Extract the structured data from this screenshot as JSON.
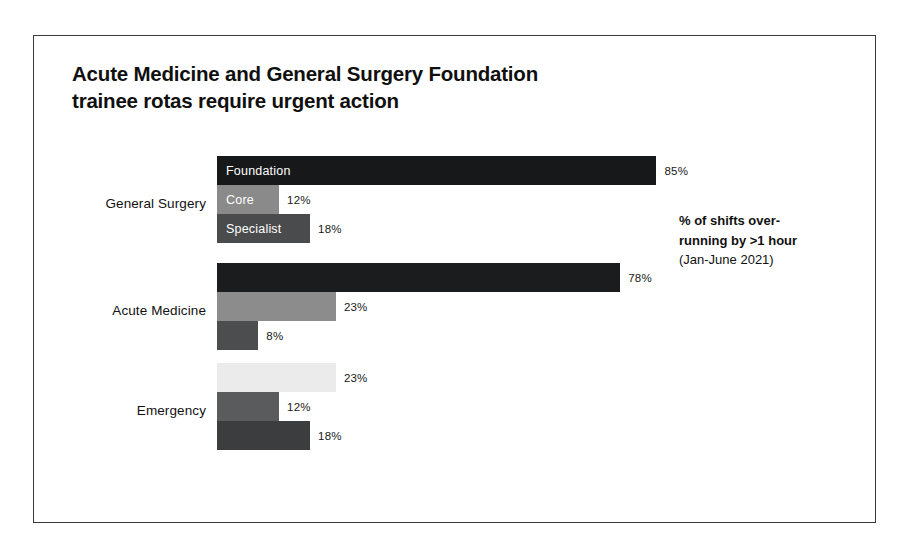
{
  "card": {
    "title_line1": "Acute Medicine and General Surgery Foundation",
    "title_line2": "trainee rotas require urgent action"
  },
  "annotation": {
    "line1": "% of shifts over-",
    "line2": "running by >1 hour",
    "line3": "(Jan-June 2021)"
  },
  "chart_data": {
    "type": "bar",
    "orientation": "horizontal",
    "title": "Acute Medicine and General Surgery Foundation trainee rotas require urgent action",
    "xlabel": "% of shifts over-running by >1 hour (Jan-June 2021)",
    "ylabel": "",
    "xlim": [
      0,
      100
    ],
    "grid": false,
    "legend_position": "in-bar (first group)",
    "categories": [
      "General Surgery",
      "Acute Medicine",
      "Emergency"
    ],
    "series": [
      {
        "name": "Foundation",
        "values": [
          85,
          78,
          23
        ]
      },
      {
        "name": "Core",
        "values": [
          12,
          23,
          12
        ]
      },
      {
        "name": "Specialist",
        "values": [
          18,
          8,
          18
        ]
      }
    ],
    "value_labels": {
      "General Surgery": [
        "85%",
        "12%",
        "18%"
      ],
      "Acute Medicine": [
        "78%",
        "23%",
        "8%"
      ],
      "Emergency": [
        "23%",
        "12%",
        "18%"
      ]
    },
    "colors": {
      "General Surgery": [
        "#17181a",
        "#8a8a8a",
        "#4a4b4d"
      ],
      "Acute Medicine": [
        "#1b1c1e",
        "#8c8c8c",
        "#4c4d4f"
      ],
      "Emergency": [
        "#ebebeb",
        "#5a5b5d",
        "#3c3d3f"
      ]
    },
    "frame_color": "#3a3a3a",
    "background": "#ffffff"
  },
  "groups": [
    {
      "label": "General Surgery",
      "bars": [
        {
          "inlabel": "Foundation",
          "value": "85%",
          "pct": 85,
          "color": "#17181a",
          "inlabel_color": "#ffffff"
        },
        {
          "inlabel": "Core",
          "value": "12%",
          "pct": 12,
          "color": "#8a8a8a",
          "inlabel_color": "#ffffff"
        },
        {
          "inlabel": "Specialist",
          "value": "18%",
          "pct": 18,
          "color": "#4a4b4d",
          "inlabel_color": "#ffffff"
        }
      ]
    },
    {
      "label": "Acute Medicine",
      "bars": [
        {
          "inlabel": "",
          "value": "78%",
          "pct": 78,
          "color": "#1b1c1e",
          "inlabel_color": "#ffffff"
        },
        {
          "inlabel": "",
          "value": "23%",
          "pct": 23,
          "color": "#8c8c8c",
          "inlabel_color": "#ffffff"
        },
        {
          "inlabel": "",
          "value": "8%",
          "pct": 8,
          "color": "#4c4d4f",
          "inlabel_color": "#ffffff"
        }
      ]
    },
    {
      "label": "Emergency",
      "bars": [
        {
          "inlabel": "",
          "value": "23%",
          "pct": 23,
          "color": "#ebebeb",
          "inlabel_color": "#111111"
        },
        {
          "inlabel": "",
          "value": "12%",
          "pct": 12,
          "color": "#5a5b5d",
          "inlabel_color": "#ffffff"
        },
        {
          "inlabel": "",
          "value": "18%",
          "pct": 18,
          "color": "#3c3d3f",
          "inlabel_color": "#ffffff"
        }
      ]
    }
  ]
}
